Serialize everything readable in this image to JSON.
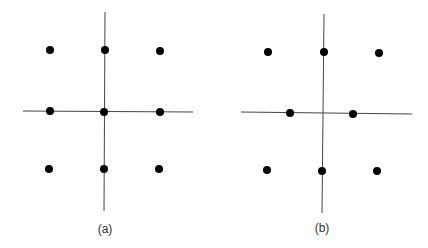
{
  "panels": [
    {
      "label": "(a)",
      "label_pos": [
        105,
        222
      ],
      "vline": [
        105,
        12,
        104,
        211
      ],
      "hline": [
        23,
        111,
        193,
        112
      ],
      "dots": [
        [
          50,
          50
        ],
        [
          105,
          50
        ],
        [
          160,
          51
        ],
        [
          50,
          111
        ],
        [
          104,
          112
        ],
        [
          160,
          112
        ],
        [
          49,
          169
        ],
        [
          104,
          169
        ],
        [
          159,
          169
        ]
      ]
    },
    {
      "label": "(b)",
      "label_pos": [
        322,
        221
      ],
      "vline": [
        324,
        14,
        322,
        213
      ],
      "hline": [
        241,
        112,
        412,
        114
      ],
      "dots": [
        [
          268,
          52
        ],
        [
          324,
          52
        ],
        [
          379,
          53
        ],
        [
          290,
          113
        ],
        [
          353,
          114
        ],
        [
          267,
          170
        ],
        [
          322,
          171
        ],
        [
          377,
          171
        ]
      ]
    }
  ],
  "colors": {
    "line": "#444444",
    "dot": "#000000"
  }
}
